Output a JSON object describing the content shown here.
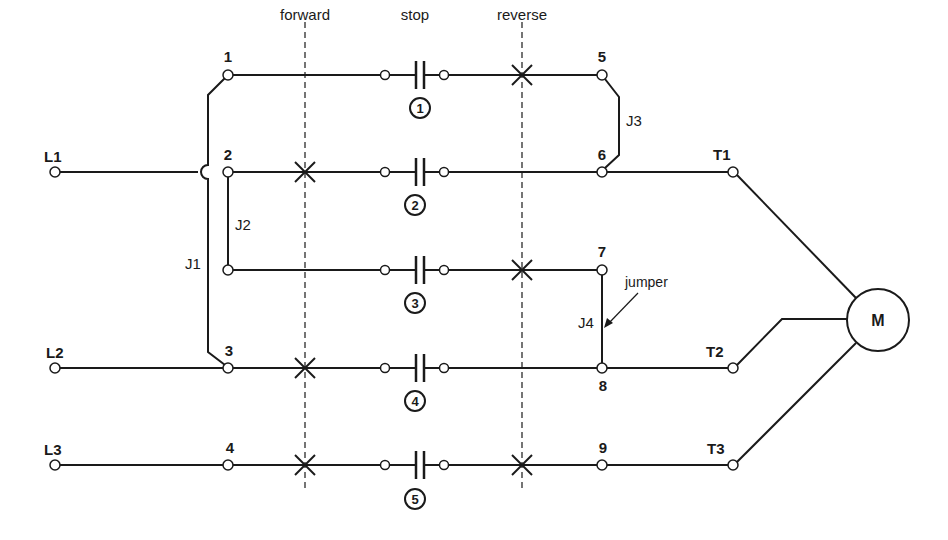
{
  "labels": {
    "forward": "forward",
    "stop": "stop",
    "reverse": "reverse",
    "jumper": "jumper",
    "motor": "M"
  },
  "lines": {
    "L1": "L1",
    "L2": "L2",
    "L3": "L3"
  },
  "terminals": {
    "T1": "T1",
    "T2": "T2",
    "T3": "T3"
  },
  "nodes": {
    "n1": "1",
    "n2": "2",
    "n3": "3",
    "n4": "4",
    "n5": "5",
    "n6": "6",
    "n7": "7",
    "n8": "8",
    "n9": "9"
  },
  "jumpers": {
    "J1": "J1",
    "J2": "J2",
    "J3": "J3",
    "J4": "J4"
  },
  "contacts": {
    "c1": "1",
    "c2": "2",
    "c3": "3",
    "c4": "4",
    "c5": "5"
  }
}
